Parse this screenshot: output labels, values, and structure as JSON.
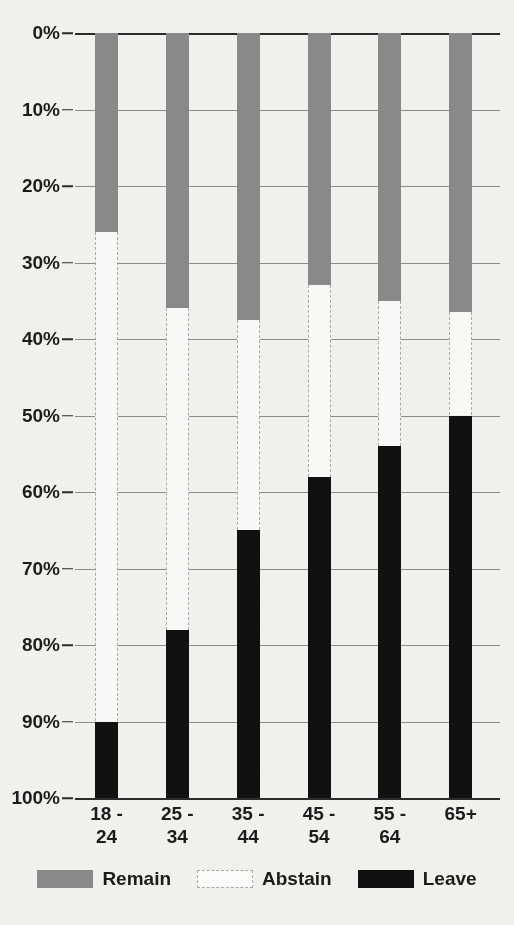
{
  "chart_data": {
    "type": "bar",
    "subtype": "stacked-100-percent",
    "title": "",
    "subtitle": "",
    "xlabel": "",
    "ylabel": "",
    "categories": [
      "18 -\n24",
      "25 -\n34",
      "35 -\n44",
      "45 -\n54",
      "55 -\n64",
      "65+"
    ],
    "series": [
      {
        "name": "Remain",
        "color": "#8a8a8a",
        "values": [
          26,
          36,
          37.5,
          33,
          35,
          36.5
        ]
      },
      {
        "name": "Abstain",
        "color": "#fdfdfc",
        "values": [
          64,
          42,
          27.5,
          25,
          19,
          13.5
        ]
      },
      {
        "name": "Leave",
        "color": "#111111",
        "values": [
          10,
          22,
          35,
          42,
          46,
          50
        ]
      }
    ],
    "ylim": [
      0,
      100
    ],
    "y_axis_inverted": true,
    "yticks": [
      "0%",
      "10%",
      "20%",
      "30%",
      "40%",
      "50%",
      "60%",
      "70%",
      "80%",
      "90%",
      "100%"
    ],
    "ytick_values": [
      0,
      10,
      20,
      30,
      40,
      50,
      60,
      70,
      80,
      90,
      100
    ],
    "grid": true,
    "legend_position": "bottom",
    "legend": [
      "Remain",
      "Abstain",
      "Leave"
    ]
  },
  "legend": {
    "items": [
      {
        "label": "Remain",
        "swatch": "remain-swatch"
      },
      {
        "label": "Abstain",
        "swatch": "abstain-swatch"
      },
      {
        "label": "Leave",
        "swatch": "leave-swatch"
      }
    ]
  },
  "colors": {
    "remain": "#8a8a8a",
    "abstain": "#fdfdfc",
    "leave": "#111111",
    "grid": "#8c8c8c",
    "axis": "#2b2b2b",
    "background": "#f4f2ef",
    "text": "#1c1c1c"
  }
}
